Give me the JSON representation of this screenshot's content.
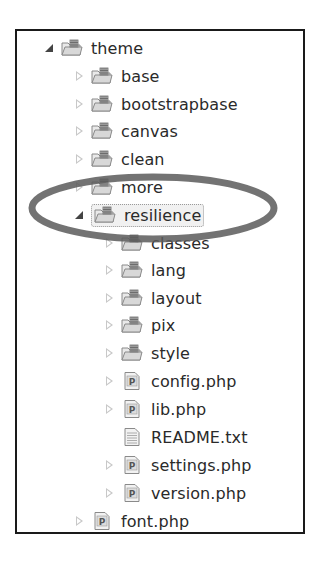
{
  "tree": {
    "items": [
      {
        "label": "theme",
        "type": "package-folder",
        "level": 0,
        "state": "expanded"
      },
      {
        "label": "base",
        "type": "package-folder",
        "level": 1,
        "state": "collapsed"
      },
      {
        "label": "bootstrapbase",
        "type": "package-folder",
        "level": 1,
        "state": "collapsed"
      },
      {
        "label": "canvas",
        "type": "package-folder",
        "level": 1,
        "state": "collapsed"
      },
      {
        "label": "clean",
        "type": "package-folder",
        "level": 1,
        "state": "collapsed"
      },
      {
        "label": "more",
        "type": "package-folder",
        "level": 1,
        "state": "collapsed"
      },
      {
        "label": "resilience",
        "type": "package-folder",
        "level": 1,
        "state": "expanded",
        "selected": true
      },
      {
        "label": "classes",
        "type": "package-folder",
        "level": 2,
        "state": "collapsed"
      },
      {
        "label": "lang",
        "type": "package-folder",
        "level": 2,
        "state": "collapsed"
      },
      {
        "label": "layout",
        "type": "package-folder",
        "level": 2,
        "state": "collapsed"
      },
      {
        "label": "pix",
        "type": "package-folder",
        "level": 2,
        "state": "collapsed"
      },
      {
        "label": "style",
        "type": "package-folder",
        "level": 2,
        "state": "collapsed"
      },
      {
        "label": "config.php",
        "type": "php-file",
        "level": 2,
        "state": "collapsed"
      },
      {
        "label": "lib.php",
        "type": "php-file",
        "level": 2,
        "state": "collapsed"
      },
      {
        "label": "README.txt",
        "type": "text-file",
        "level": 2,
        "state": "none"
      },
      {
        "label": "settings.php",
        "type": "php-file",
        "level": 2,
        "state": "collapsed"
      },
      {
        "label": "version.php",
        "type": "php-file",
        "level": 2,
        "state": "collapsed"
      },
      {
        "label": "font.php",
        "type": "php-file",
        "level": 1,
        "state": "collapsed"
      }
    ]
  },
  "annotation": {
    "shape": "ellipse",
    "highlights": "resilience",
    "color": "#555555"
  }
}
